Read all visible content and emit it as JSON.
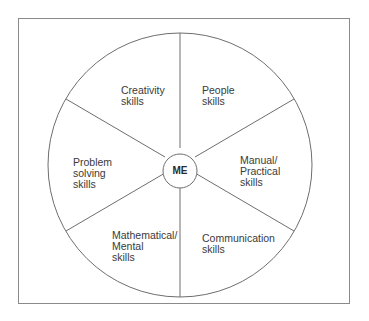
{
  "diagram": {
    "center_label": "ME",
    "segments": [
      {
        "label": "Creativity\nskills"
      },
      {
        "label": "People\nskills"
      },
      {
        "label": "Manual/\nPractical\nskills"
      },
      {
        "label": "Communication\nskills"
      },
      {
        "label": "Mathematical/\nMental\nskills"
      },
      {
        "label": "Problem\nsolving\nskills"
      }
    ]
  }
}
